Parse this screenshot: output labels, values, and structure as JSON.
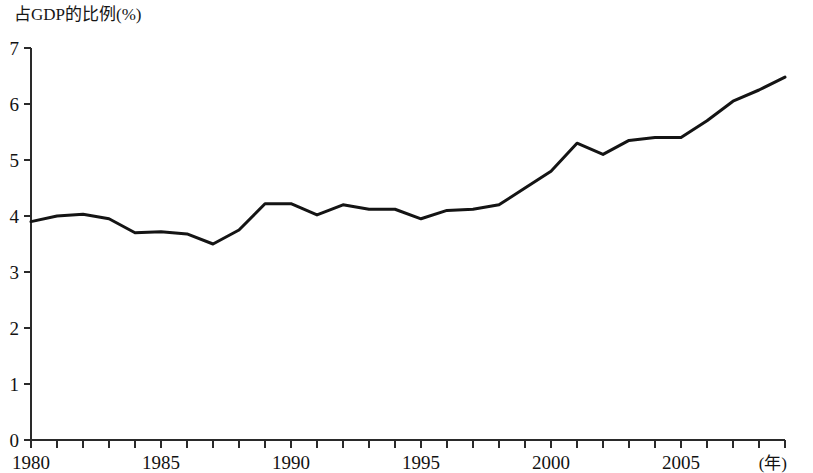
{
  "chart_data": {
    "type": "line",
    "title": "",
    "ylabel": "占GDP的比例(%)",
    "xlabel": "(年)",
    "xlim": [
      1980,
      2009
    ],
    "ylim": [
      0,
      7
    ],
    "grid": false,
    "legend": null,
    "y_ticks": [
      0,
      1,
      2,
      3,
      4,
      5,
      6,
      7
    ],
    "y_tick_labels": [
      "0",
      "1",
      "2",
      "3",
      "4",
      "5",
      "6",
      "7"
    ],
    "x_ticks": [
      1980,
      1981,
      1982,
      1983,
      1984,
      1985,
      1986,
      1987,
      1988,
      1989,
      1990,
      1991,
      1992,
      1993,
      1994,
      1995,
      1996,
      1997,
      1998,
      1999,
      2000,
      2001,
      2002,
      2003,
      2004,
      2005,
      2006,
      2007,
      2008,
      2009
    ],
    "x_tick_labels": [
      "1980",
      "",
      "",
      "",
      "",
      "1985",
      "",
      "",
      "",
      "",
      "1990",
      "",
      "",
      "",
      "",
      "1995",
      "",
      "",
      "",
      "",
      "2000",
      "",
      "",
      "",
      "",
      "2005",
      "",
      "",
      "",
      ""
    ],
    "x_labeled_ticks": [
      1980,
      1985,
      1990,
      1995,
      2000,
      2005
    ],
    "x": [
      1980,
      1981,
      1982,
      1983,
      1984,
      1985,
      1986,
      1987,
      1988,
      1989,
      1990,
      1991,
      1992,
      1993,
      1994,
      1995,
      1996,
      1997,
      1998,
      1999,
      2000,
      2001,
      2002,
      2003,
      2004,
      2005,
      2006,
      2007,
      2008,
      2009
    ],
    "values": [
      3.9,
      4.0,
      4.03,
      3.95,
      3.7,
      3.72,
      3.68,
      3.5,
      3.75,
      4.22,
      4.22,
      4.02,
      4.2,
      4.12,
      4.12,
      3.95,
      4.1,
      4.12,
      4.2,
      4.5,
      4.8,
      5.3,
      5.1,
      5.35,
      5.4,
      5.4,
      5.7,
      6.05,
      6.25,
      6.48
    ],
    "series_color": "#141414",
    "axis_color": "#2a2a2a",
    "background": "#ffffff"
  }
}
